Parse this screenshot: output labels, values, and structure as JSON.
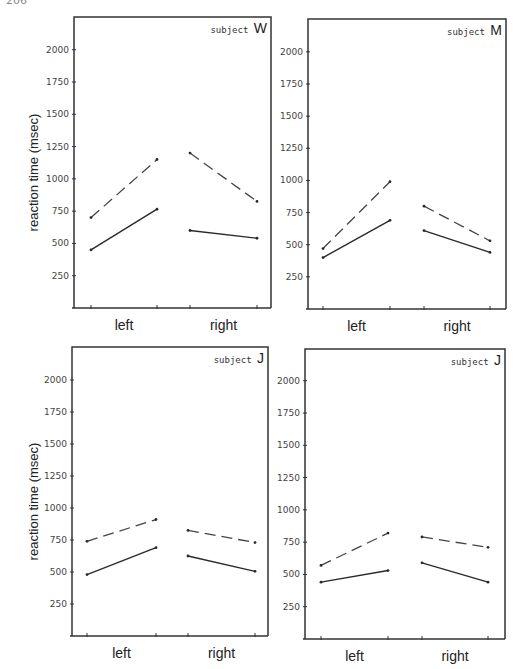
{
  "page": {
    "number": "206"
  },
  "chart_data": [
    {
      "type": "line",
      "panel": "top-left",
      "title": "subject W",
      "subject_prefix": "subject",
      "subject_letter": "W",
      "ylabel": "reaction time (msec)",
      "xlabel": "",
      "ylim": [
        0,
        2250
      ],
      "yticks": [
        250,
        500,
        750,
        1000,
        1250,
        1500,
        1750,
        2000
      ],
      "categories": [
        "left",
        "right"
      ],
      "grid": false,
      "legend": null,
      "series": [
        {
          "name": "dashed",
          "style": "dashed",
          "left": [
            700,
            1150
          ],
          "right": [
            1200,
            825
          ]
        },
        {
          "name": "solid",
          "style": "solid",
          "left": [
            450,
            765
          ],
          "right": [
            600,
            540
          ]
        }
      ],
      "frame": {
        "x0": 74,
        "x1": 271,
        "top": 17,
        "base": 308,
        "y2000": 50,
        "y250": 276
      },
      "xticks_px": [
        91,
        157,
        190,
        257
      ],
      "show_ylabel": true
    },
    {
      "type": "line",
      "panel": "top-right",
      "title": "subject M",
      "subject_prefix": "subject",
      "subject_letter": "M",
      "ylabel": "",
      "xlabel": "",
      "ylim": [
        0,
        2250
      ],
      "yticks": [
        250,
        500,
        750,
        1000,
        1250,
        1500,
        1750,
        2000
      ],
      "categories": [
        "left",
        "right"
      ],
      "grid": false,
      "legend": null,
      "series": [
        {
          "name": "dashed",
          "style": "dashed",
          "left": [
            470,
            990
          ],
          "right": [
            800,
            530
          ]
        },
        {
          "name": "solid",
          "style": "solid",
          "left": [
            400,
            690
          ],
          "right": [
            610,
            440
          ]
        }
      ],
      "frame": {
        "x0": 308,
        "x1": 506,
        "top": 19,
        "base": 309,
        "y2000": 52,
        "y250": 277
      },
      "xticks_px": [
        323,
        390,
        424,
        490
      ],
      "show_ylabel": false
    },
    {
      "type": "line",
      "panel": "bottom-left",
      "title": "subject J",
      "subject_prefix": "subject",
      "subject_letter": "J",
      "ylabel": "reaction time (msec)",
      "xlabel": "",
      "ylim": [
        0,
        2250
      ],
      "yticks": [
        250,
        500,
        750,
        1000,
        1250,
        1500,
        1750,
        2000
      ],
      "categories": [
        "left",
        "right"
      ],
      "grid": false,
      "legend": null,
      "series": [
        {
          "name": "dashed",
          "style": "dashed",
          "left": [
            740,
            910
          ],
          "right": [
            825,
            730
          ]
        },
        {
          "name": "solid",
          "style": "solid",
          "left": [
            480,
            690
          ],
          "right": [
            625,
            505
          ]
        }
      ],
      "frame": {
        "x0": 72,
        "x1": 268,
        "top": 347,
        "base": 636,
        "y2000": 381,
        "y250": 605
      },
      "xticks_px": [
        87,
        156,
        188,
        255
      ],
      "show_ylabel": true
    },
    {
      "type": "line",
      "panel": "bottom-right",
      "title": "subject J",
      "subject_prefix": "subject",
      "subject_letter": "J",
      "ylabel": "",
      "xlabel": "",
      "ylim": [
        0,
        2250
      ],
      "yticks": [
        250,
        500,
        750,
        1000,
        1250,
        1500,
        1750,
        2000
      ],
      "categories": [
        "left",
        "right"
      ],
      "grid": false,
      "legend": null,
      "series": [
        {
          "name": "dashed",
          "style": "dashed",
          "left": [
            570,
            820
          ],
          "right": [
            790,
            710
          ]
        },
        {
          "name": "solid",
          "style": "solid",
          "left": [
            440,
            530
          ],
          "right": [
            590,
            440
          ]
        }
      ],
      "frame": {
        "x0": 305,
        "x1": 505,
        "top": 349,
        "base": 639,
        "y2000": 383,
        "y250": 609
      },
      "xticks_px": [
        321,
        388,
        422,
        488
      ],
      "show_ylabel": false
    }
  ]
}
